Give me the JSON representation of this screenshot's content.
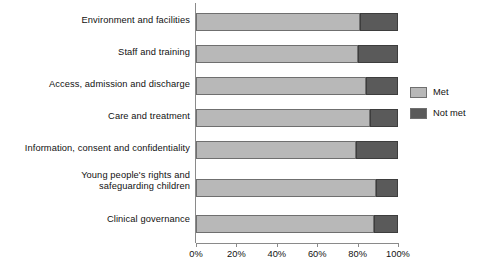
{
  "chart_data": {
    "type": "bar",
    "orientation": "horizontal",
    "stacked": true,
    "stack_mode": "percent",
    "title": "",
    "subtitle": "",
    "xlabel": "",
    "ylabel": "",
    "xlim": [
      0,
      100
    ],
    "grid": false,
    "legend_position": "right",
    "categories": [
      "Environment and facilities",
      "Staff and training",
      "Access, admission and discharge",
      "Care and treatment",
      "Information, consent and confidentiality",
      "Young people's rights and\nsafeguarding children",
      "Clinical governance"
    ],
    "tick_labels": [
      "0%",
      "20%",
      "40%",
      "60%",
      "80%",
      "100%"
    ],
    "tick_values": [
      0,
      20,
      40,
      60,
      80,
      100
    ],
    "series": [
      {
        "name": "Met",
        "color": "#b8b8b8",
        "values": [
          81,
          80,
          84,
          86,
          79,
          89,
          88
        ]
      },
      {
        "name": "Not met",
        "color": "#5a5a5a",
        "values": [
          19,
          20,
          16,
          14,
          21,
          11,
          12
        ]
      }
    ]
  },
  "legend": {
    "items": [
      {
        "label": "Met",
        "color": "#b8b8b8"
      },
      {
        "label": "Not met",
        "color": "#5a5a5a"
      }
    ]
  }
}
